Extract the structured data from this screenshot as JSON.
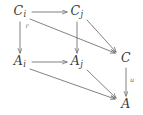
{
  "diagram": {
    "kind": "commutative-diagram",
    "background_color": "#ffffff",
    "ink_color": "#6b6b6b",
    "label_color": "#3a3a3a",
    "nodes": [
      {
        "id": "Ci",
        "base": "C",
        "sub": "i",
        "x": 20,
        "y": 12
      },
      {
        "id": "Cj",
        "base": "C",
        "sub": "j",
        "x": 77,
        "y": 12
      },
      {
        "id": "C",
        "base": "C",
        "sub": "",
        "x": 126,
        "y": 59
      },
      {
        "id": "Ai",
        "base": "A",
        "sub": "i",
        "x": 20,
        "y": 62
      },
      {
        "id": "Aj",
        "base": "A",
        "sub": "j",
        "x": 77,
        "y": 62
      },
      {
        "id": "A",
        "base": "A",
        "sub": "",
        "x": 126,
        "y": 105
      }
    ],
    "edges": [
      {
        "id": "Ci-to-Cj",
        "from": "Ci",
        "to": "Cj",
        "style": "horizontal",
        "label": ""
      },
      {
        "id": "Ai-to-Aj",
        "from": "Ai",
        "to": "Aj",
        "style": "horizontal",
        "label": ""
      },
      {
        "id": "Ci-to-Ai",
        "from": "Ci",
        "to": "Ai",
        "style": "vertical",
        "label": "r"
      },
      {
        "id": "Cj-to-Aj",
        "from": "Cj",
        "to": "Aj",
        "style": "vertical",
        "label": ""
      },
      {
        "id": "C-to-A",
        "from": "C",
        "to": "A",
        "style": "vertical",
        "label": "u"
      },
      {
        "id": "Ci-to-C",
        "from": "Ci",
        "to": "C",
        "style": "diagonal",
        "label": ""
      },
      {
        "id": "Cj-to-C",
        "from": "Cj",
        "to": "C",
        "style": "diagonal",
        "label": ""
      },
      {
        "id": "Ai-to-A",
        "from": "Ai",
        "to": "A",
        "style": "diagonal",
        "label": ""
      },
      {
        "id": "Aj-to-A",
        "from": "Aj",
        "to": "A",
        "style": "diagonal",
        "label": ""
      }
    ],
    "edge_labels": {
      "Ci_to_Ai": "r",
      "C_to_A": "u"
    }
  }
}
